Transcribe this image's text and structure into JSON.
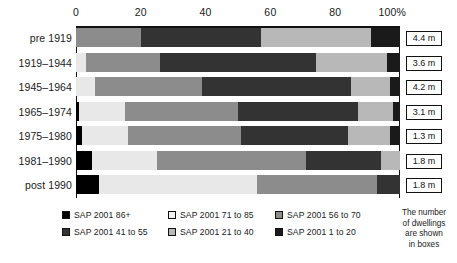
{
  "chart_data": {
    "type": "bar",
    "orientation": "horizontal",
    "stacked": true,
    "title": "",
    "xlabel": "",
    "ylabel": "",
    "xlim": [
      0,
      100
    ],
    "grid": false,
    "legend_position": "bottom",
    "axis_tick_labels": [
      "0",
      "20",
      "40",
      "60",
      "80",
      "100%"
    ],
    "axis_tick_values": [
      0,
      20,
      40,
      60,
      80,
      100
    ],
    "categories": [
      "pre 1919",
      "1919–1944",
      "1945–1964",
      "1965–1974",
      "1975–1980",
      "1981–1990",
      "post 1990"
    ],
    "series": [
      {
        "name": "SAP 2001 86+",
        "color": "#000000",
        "values": [
          0,
          0,
          0,
          1,
          2,
          5,
          7
        ]
      },
      {
        "name": "SAP 2001 71 to 85",
        "color": "#e8e8e8",
        "values": [
          0,
          3,
          6,
          14,
          14,
          20,
          49
        ]
      },
      {
        "name": "SAP 2001 56 to 70",
        "color": "#8c8c8c",
        "values": [
          20,
          23,
          33,
          35,
          35,
          46,
          37
        ]
      },
      {
        "name": "SAP 2001 41 to 55",
        "color": "#333333",
        "values": [
          37,
          48,
          46,
          37,
          33,
          23,
          7
        ]
      },
      {
        "name": "SAP 2001 21 to 40",
        "color": "#b8b8b8",
        "values": [
          34,
          22,
          12,
          11,
          13,
          6,
          0
        ]
      },
      {
        "name": "SAP 2001 1 to 20",
        "color": "#1a1a1a",
        "values": [
          9,
          4,
          3,
          2,
          3,
          0,
          0
        ]
      }
    ],
    "value_boxes": {
      "label": "The number of dwellings are shown in boxes",
      "unit": "m",
      "values": [
        "4.4 m",
        "3.6 m",
        "4.2 m",
        "3.1 m",
        "1.3 m",
        "1.8 m",
        "1.8 m"
      ]
    }
  },
  "axis": {
    "ticks": [
      {
        "label": "0",
        "value": 0
      },
      {
        "label": "20",
        "value": 20
      },
      {
        "label": "40",
        "value": 40
      },
      {
        "label": "60",
        "value": 60
      },
      {
        "label": "80",
        "value": 80
      },
      {
        "label": "100%",
        "value": 100
      }
    ]
  },
  "rows": [
    {
      "label": "pre 1919",
      "box": "4.4 m",
      "segments": [
        {
          "key": "SAP 2001 56 to 70",
          "color": "#8c8c8c",
          "value": 20
        },
        {
          "key": "SAP 2001 41 to 55",
          "color": "#333333",
          "value": 37
        },
        {
          "key": "SAP 2001 21 to 40",
          "color": "#b8b8b8",
          "value": 34
        },
        {
          "key": "SAP 2001 1 to 20",
          "color": "#1a1a1a",
          "value": 9
        }
      ]
    },
    {
      "label": "1919–1944",
      "box": "3.6 m",
      "segments": [
        {
          "key": "SAP 2001 71 to 85",
          "color": "#e8e8e8",
          "value": 3
        },
        {
          "key": "SAP 2001 56 to 70",
          "color": "#8c8c8c",
          "value": 23
        },
        {
          "key": "SAP 2001 41 to 55",
          "color": "#333333",
          "value": 48
        },
        {
          "key": "SAP 2001 21 to 40",
          "color": "#b8b8b8",
          "value": 22
        },
        {
          "key": "SAP 2001 1 to 20",
          "color": "#1a1a1a",
          "value": 4
        }
      ]
    },
    {
      "label": "1945–1964",
      "box": "4.2 m",
      "segments": [
        {
          "key": "SAP 2001 71 to 85",
          "color": "#e8e8e8",
          "value": 6
        },
        {
          "key": "SAP 2001 56 to 70",
          "color": "#8c8c8c",
          "value": 33
        },
        {
          "key": "SAP 2001 41 to 55",
          "color": "#333333",
          "value": 46
        },
        {
          "key": "SAP 2001 21 to 40",
          "color": "#b8b8b8",
          "value": 12
        },
        {
          "key": "SAP 2001 1 to 20",
          "color": "#1a1a1a",
          "value": 3
        }
      ]
    },
    {
      "label": "1965–1974",
      "box": "3.1 m",
      "segments": [
        {
          "key": "SAP 2001 86+",
          "color": "#000000",
          "value": 1
        },
        {
          "key": "SAP 2001 71 to 85",
          "color": "#e8e8e8",
          "value": 14
        },
        {
          "key": "SAP 2001 56 to 70",
          "color": "#8c8c8c",
          "value": 35
        },
        {
          "key": "SAP 2001 41 to 55",
          "color": "#333333",
          "value": 37
        },
        {
          "key": "SAP 2001 21 to 40",
          "color": "#b8b8b8",
          "value": 11
        },
        {
          "key": "SAP 2001 1 to 20",
          "color": "#1a1a1a",
          "value": 2
        }
      ]
    },
    {
      "label": "1975–1980",
      "box": "1.3 m",
      "segments": [
        {
          "key": "SAP 2001 86+",
          "color": "#000000",
          "value": 2
        },
        {
          "key": "SAP 2001 71 to 85",
          "color": "#e8e8e8",
          "value": 14
        },
        {
          "key": "SAP 2001 56 to 70",
          "color": "#8c8c8c",
          "value": 35
        },
        {
          "key": "SAP 2001 41 to 55",
          "color": "#333333",
          "value": 33
        },
        {
          "key": "SAP 2001 21 to 40",
          "color": "#b8b8b8",
          "value": 13
        },
        {
          "key": "SAP 2001 1 to 20",
          "color": "#1a1a1a",
          "value": 3
        }
      ]
    },
    {
      "label": "1981–1990",
      "box": "1.8 m",
      "segments": [
        {
          "key": "SAP 2001 86+",
          "color": "#000000",
          "value": 5
        },
        {
          "key": "SAP 2001 71 to 85",
          "color": "#e8e8e8",
          "value": 20
        },
        {
          "key": "SAP 2001 56 to 70",
          "color": "#8c8c8c",
          "value": 46
        },
        {
          "key": "SAP 2001 41 to 55",
          "color": "#333333",
          "value": 23
        },
        {
          "key": "SAP 2001 21 to 40",
          "color": "#b8b8b8",
          "value": 6
        }
      ]
    },
    {
      "label": "post 1990",
      "box": "1.8 m",
      "segments": [
        {
          "key": "SAP 2001 86+",
          "color": "#000000",
          "value": 7
        },
        {
          "key": "SAP 2001 71 to 85",
          "color": "#e8e8e8",
          "value": 49
        },
        {
          "key": "SAP 2001 56 to 70",
          "color": "#8c8c8c",
          "value": 37
        },
        {
          "key": "SAP 2001 41 to 55",
          "color": "#333333",
          "value": 7
        }
      ]
    }
  ],
  "legend": {
    "items": [
      {
        "label": "SAP 2001 86+",
        "color": "#000000",
        "col": 0,
        "row": 0
      },
      {
        "label": "SAP 2001 71 to 85",
        "color": "#f2f2f2",
        "col": 1,
        "row": 0
      },
      {
        "label": "SAP 2001 56 to 70",
        "color": "#8c8c8c",
        "col": 2,
        "row": 0
      },
      {
        "label": "SAP 2001 41 to 55",
        "color": "#333333",
        "col": 0,
        "row": 1
      },
      {
        "label": "SAP 2001 21 to 40",
        "color": "#b8b8b8",
        "col": 1,
        "row": 1
      },
      {
        "label": "SAP 2001 1 to 20",
        "color": "#1a1a1a",
        "col": 2,
        "row": 1
      }
    ]
  },
  "note": {
    "line1": "The number",
    "line2": "of dwellings",
    "line3": "are shown",
    "line4": "in boxes"
  }
}
